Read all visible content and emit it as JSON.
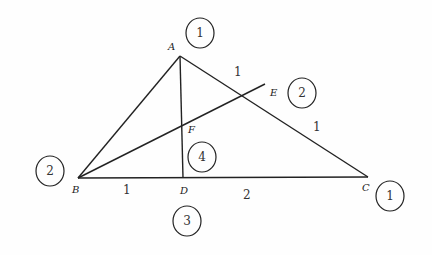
{
  "diagram": {
    "type": "geometry-triangle",
    "points": {
      "A": {
        "label": "A",
        "x": 180,
        "y": 56
      },
      "B": {
        "label": "B",
        "x": 78,
        "y": 178
      },
      "C": {
        "label": "C",
        "x": 368,
        "y": 177
      },
      "D": {
        "label": "D",
        "x": 183,
        "y": 178
      },
      "E": {
        "label": "E",
        "x": 265,
        "y": 84
      },
      "F": {
        "label": "F",
        "x": 182,
        "y": 141
      }
    },
    "segments": [
      [
        "A",
        "B"
      ],
      [
        "A",
        "C"
      ],
      [
        "B",
        "C"
      ],
      [
        "A",
        "D"
      ],
      [
        "B",
        "E"
      ]
    ],
    "length_labels": [
      {
        "text": "1",
        "segment": "AE",
        "x": 237,
        "y": 75
      },
      {
        "text": "1",
        "segment": "EC",
        "x": 316,
        "y": 130
      },
      {
        "text": "1",
        "segment": "BD",
        "x": 126,
        "y": 193
      },
      {
        "text": "2",
        "segment": "DC",
        "x": 246,
        "y": 198
      }
    ],
    "circled_numbers": [
      {
        "text": "1",
        "near": "A",
        "cx": 200,
        "cy": 33
      },
      {
        "text": "2",
        "near": "E",
        "cx": 302,
        "cy": 93
      },
      {
        "text": "2",
        "near": "B",
        "cx": 50,
        "cy": 171
      },
      {
        "text": "4",
        "near": "F",
        "cx": 202,
        "cy": 157
      },
      {
        "text": "3",
        "near": "D",
        "cx": 187,
        "cy": 221
      },
      {
        "text": "1",
        "near": "C",
        "cx": 390,
        "cy": 196
      }
    ]
  },
  "labels": {
    "A": "A",
    "B": "B",
    "C": "C",
    "D": "D",
    "E": "E",
    "F": "F",
    "len_AE": "1",
    "len_EC": "1",
    "len_BD": "1",
    "len_DC": "2",
    "circ_A": "1",
    "circ_E": "2",
    "circ_B": "2",
    "circ_F": "4",
    "circ_D": "3",
    "circ_C": "1"
  }
}
